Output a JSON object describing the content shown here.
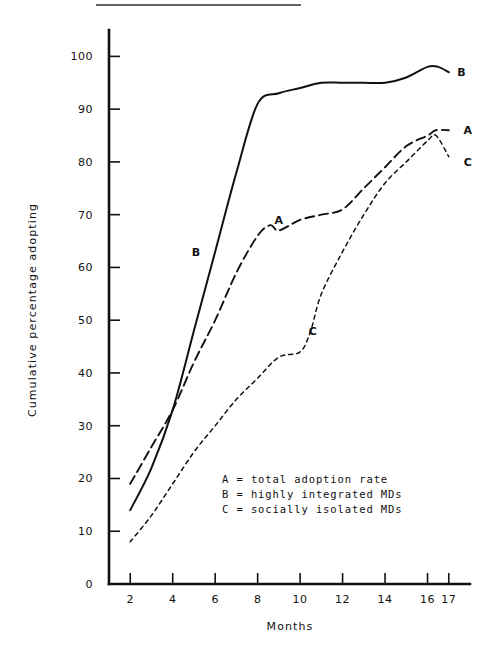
{
  "figure": {
    "top_rule": true,
    "background_color": "#ffffff",
    "ink_color": "#111111"
  },
  "chart_data": {
    "type": "line",
    "title": "",
    "xlabel": "Months",
    "ylabel": "Cumulative percentage adopting",
    "xlim": [
      1,
      18
    ],
    "ylim": [
      0,
      105
    ],
    "grid": false,
    "legend_position": "inside-lower-right",
    "x_ticks": [
      2,
      4,
      6,
      8,
      10,
      12,
      14,
      16,
      17
    ],
    "x_tick_labels": [
      "2",
      "4",
      "6",
      "8",
      "10",
      "12",
      "14",
      "16",
      "17"
    ],
    "y_ticks": [
      0,
      10,
      20,
      30,
      40,
      50,
      60,
      70,
      80,
      90,
      100
    ],
    "y_tick_labels": [
      "0",
      "10",
      "20",
      "30",
      "40",
      "50",
      "60",
      "70",
      "80",
      "90",
      "100"
    ],
    "series": [
      {
        "name": "A",
        "label": "A = total adoption rate",
        "legend_key": "A",
        "style": "long-dashed",
        "end_label": "A",
        "inline_label": "A",
        "x": [
          2,
          3,
          4,
          5,
          6,
          7,
          8,
          8.6,
          9,
          10,
          11,
          12,
          13,
          14,
          15,
          16,
          16.4,
          17
        ],
        "values": [
          19,
          26,
          33,
          42,
          50,
          59,
          66,
          68,
          67,
          69,
          70,
          71,
          75,
          79,
          83,
          85,
          86,
          86
        ]
      },
      {
        "name": "B",
        "label": "B = highly integrated MDs",
        "legend_key": "B",
        "style": "solid",
        "end_label": "B",
        "inline_label": "B",
        "x": [
          2,
          3,
          4,
          5,
          6,
          7,
          8,
          9,
          10,
          11,
          12,
          13,
          14,
          15,
          16,
          16.5,
          17
        ],
        "values": [
          14,
          22,
          33,
          48,
          63,
          78,
          91,
          93,
          94,
          95,
          95,
          95,
          95,
          96,
          98,
          98,
          97
        ]
      },
      {
        "name": "C",
        "label": "C = socially isolated MDs",
        "legend_key": "C",
        "style": "short-dashed",
        "end_label": "C",
        "inline_label": "C",
        "x": [
          2,
          3,
          4,
          5,
          6,
          7,
          8,
          9,
          10,
          10.5,
          11,
          12,
          13,
          14,
          15,
          16,
          16.4,
          17
        ],
        "values": [
          8,
          13,
          19,
          25,
          30,
          35,
          39,
          43,
          44,
          48,
          55,
          63,
          70,
          76,
          80,
          84,
          85,
          81
        ]
      }
    ],
    "series_annotations": [
      {
        "text": "B",
        "x": 5.1,
        "y": 63
      },
      {
        "text": "A",
        "x": 9.0,
        "y": 69
      },
      {
        "text": "C",
        "x": 10.6,
        "y": 48
      },
      {
        "text": "B",
        "x": 17.6,
        "y": 97
      },
      {
        "text": "A",
        "x": 17.9,
        "y": 86
      },
      {
        "text": "C",
        "x": 17.9,
        "y": 80
      }
    ],
    "legend_entries": [
      "A = total adoption rate",
      "B = highly integrated MDs",
      "C = socially isolated MDs"
    ]
  }
}
